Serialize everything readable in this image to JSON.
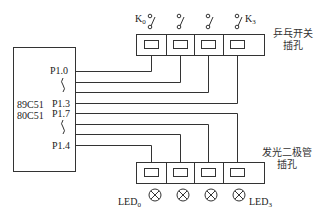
{
  "chip": {
    "names": [
      "89C51",
      "80C51"
    ],
    "pins": {
      "p10": "P1.0",
      "p13": "P1.3",
      "p17": "P1.7",
      "p14": "P1.4"
    }
  },
  "switch_socket": {
    "label_line1": "乒乓开关",
    "label_line2": "插孔",
    "first_switch": {
      "base": "K",
      "sub": "0"
    },
    "last_switch": {
      "base": "K",
      "sub": "3"
    },
    "count": 4
  },
  "led_socket": {
    "label_line1": "发光二极管",
    "label_line2": "插孔",
    "first_led": {
      "base": "LED",
      "sub": "0"
    },
    "last_led": {
      "base": "LED",
      "sub": "3"
    },
    "count": 4
  },
  "colors": {
    "line": "#333333",
    "background": "#ffffff"
  }
}
